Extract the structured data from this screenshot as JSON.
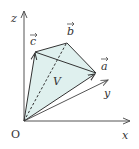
{
  "diagram": {
    "type": "3d-vector-parallelepiped-volume",
    "origin_label": "O",
    "axes": {
      "x": {
        "label": "x"
      },
      "y": {
        "label": "y"
      },
      "z": {
        "label": "z"
      }
    },
    "vectors": [
      {
        "name": "a",
        "label": "a"
      },
      {
        "name": "b",
        "label": "b"
      },
      {
        "name": "c",
        "label": "c"
      }
    ],
    "volume_label": "V",
    "colors": {
      "fill": "#dff0ee",
      "stroke": "#333333",
      "axis": "#555555"
    }
  }
}
